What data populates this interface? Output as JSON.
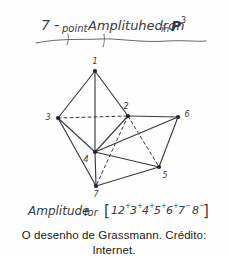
{
  "figure": {
    "title_handwritten": "7 - point Amplituhedron in P³",
    "title_parts": {
      "prefix": "7 -",
      "word1": "point",
      "word2": "Amplituhedron",
      "word3": "in",
      "symbol": "P",
      "exponent": "3"
    },
    "formula_handwritten": "Amplitude for [1 2⁺3⁺4⁺5⁺6⁺7⁻8⁻]",
    "formula_parts": {
      "label": "Amplitude",
      "connector": "for",
      "bracket_open": "[",
      "bracket_close": "]",
      "terms": [
        {
          "index": "1",
          "sign": ""
        },
        {
          "index": "2",
          "sign": "+"
        },
        {
          "index": "3",
          "sign": "+"
        },
        {
          "index": "4",
          "sign": "+"
        },
        {
          "index": "5",
          "sign": "+"
        },
        {
          "index": "6",
          "sign": "+"
        },
        {
          "index": "7",
          "sign": "-"
        },
        {
          "index": "8",
          "sign": "-"
        }
      ]
    },
    "ink_color": "#3a3a42",
    "vertices": [
      {
        "id": "v1",
        "label": "1",
        "x": 95,
        "y": 71,
        "lx": 95,
        "ly": 62
      },
      {
        "id": "v2",
        "label": "2",
        "x": 128,
        "y": 116,
        "lx": 125,
        "ly": 107
      },
      {
        "id": "v3",
        "label": "3",
        "x": 58,
        "y": 118,
        "lx": 47,
        "ly": 117
      },
      {
        "id": "v4",
        "label": "4",
        "x": 95,
        "y": 152,
        "lx": 86,
        "ly": 160
      },
      {
        "id": "v5",
        "label": "5",
        "x": 159,
        "y": 167,
        "lx": 163,
        "ly": 177
      },
      {
        "id": "v6",
        "label": "6",
        "x": 178,
        "y": 117,
        "lx": 187,
        "ly": 115
      },
      {
        "id": "v7",
        "label": "7",
        "x": 96,
        "y": 186,
        "lx": 95,
        "ly": 196
      }
    ],
    "edges_solid": [
      {
        "from": "v1",
        "to": "v3"
      },
      {
        "from": "v1",
        "to": "v2"
      },
      {
        "from": "v1",
        "to": "v4"
      },
      {
        "from": "v3",
        "to": "v4"
      },
      {
        "from": "v3",
        "to": "v7"
      },
      {
        "from": "v2",
        "to": "v4"
      },
      {
        "from": "v2",
        "to": "v6"
      },
      {
        "from": "v4",
        "to": "v6"
      },
      {
        "from": "v4",
        "to": "v5"
      },
      {
        "from": "v4",
        "to": "v7"
      },
      {
        "from": "v5",
        "to": "v6"
      },
      {
        "from": "v5",
        "to": "v7"
      }
    ],
    "edges_dashed": [
      {
        "from": "v3",
        "to": "v2"
      },
      {
        "from": "v2",
        "to": "v5"
      },
      {
        "from": "v2",
        "to": "v7"
      }
    ]
  },
  "caption": {
    "text": "O desenho de Grassmann. Crédito: Internet."
  }
}
